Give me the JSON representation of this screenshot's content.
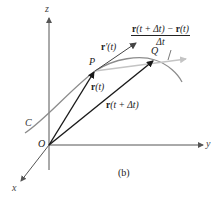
{
  "figure": {
    "panel_label": "(b)",
    "axes": {
      "x_label": "x",
      "y_label": "y",
      "z_label": "z",
      "origin_label": "O"
    },
    "curve_label": "C",
    "points": {
      "P": "P",
      "Q": "Q"
    },
    "vectors": {
      "r_t": {
        "bold": "r",
        "arg": "(t)"
      },
      "r_t_dt": {
        "bold": "r",
        "arg": "(t + Δt)"
      },
      "r_prime": {
        "bold": "r",
        "arg": "′(t)"
      }
    },
    "difference_quotient": {
      "numerator": "r(t + Δt) − r(t)",
      "numerator_parts": {
        "r1": "r",
        "a1": "(t + Δt) − ",
        "r2": "r",
        "a2": "(t)"
      },
      "denominator": "Δt"
    },
    "colors": {
      "axis": "#555555",
      "vector": "#1a1a1a",
      "curve": "#8c8c8c",
      "secant": "#bdbdbd",
      "tangent": "#444444"
    }
  }
}
